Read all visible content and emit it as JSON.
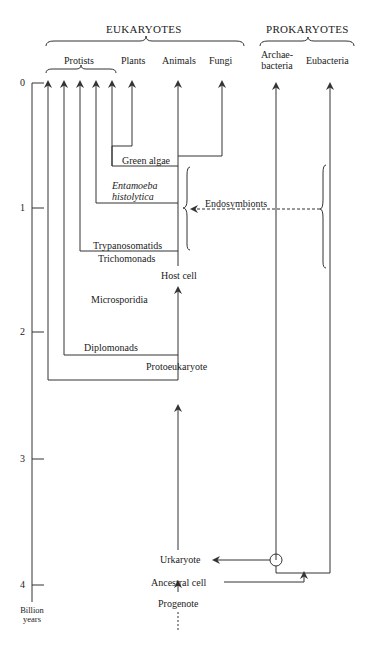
{
  "groups": {
    "eukaryotes": "EUKARYOTES",
    "prokaryotes": "PROKARYOTES",
    "protists": "Protists"
  },
  "taxa": {
    "plants": "Plants",
    "animals": "Animals",
    "fungi": "Fungi",
    "archaebacteria_1": "Archae-",
    "archaebacteria_2": "bacteria",
    "eubacteria": "Eubacteria"
  },
  "lineages": {
    "green_algae": "Green algae",
    "entamoeba_1": "Entamoeba",
    "entamoeba_2": "histolytica",
    "endosymbionts": "Endosymbionts",
    "trypanosomatids": "Trypanosomatids",
    "trichomonads": "Trichomonads",
    "host_cell": "Host cell",
    "microsporidia": "Microsporidia",
    "diplomonads": "Diplomonads",
    "protoeukaryote": "Protoeukaryote",
    "urkaryote": "Urkaryote",
    "ancestral_cell": "Ancestral cell",
    "progenote": "Progenote"
  },
  "axis": {
    "ticks": [
      "0",
      "1",
      "2",
      "3",
      "4"
    ],
    "unit_1": "Billion",
    "unit_2": "years"
  },
  "colors": {
    "line": "#333333",
    "text": "#222222"
  }
}
